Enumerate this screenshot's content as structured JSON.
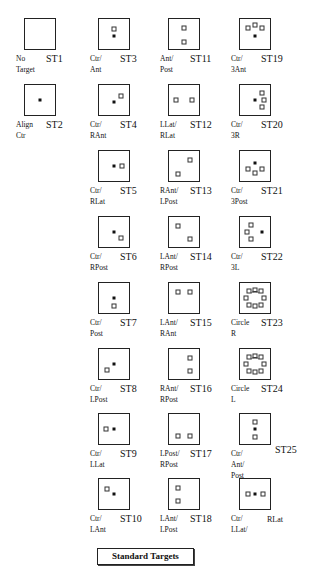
{
  "title": "Standard Targets",
  "targets": [
    {
      "code": "ST1",
      "label": [
        "No",
        "Target"
      ],
      "col": 0,
      "row": 0,
      "points": []
    },
    {
      "code": "ST2",
      "label": [
        "Align",
        "Ctr"
      ],
      "col": 0,
      "row": 1,
      "points": [
        {
          "x": 0.5,
          "y": 0.5,
          "t": "c"
        }
      ]
    },
    {
      "code": "ST3",
      "label": [
        "Ctr/",
        "Ant"
      ],
      "col": 1,
      "row": 0,
      "points": [
        {
          "x": 0.5,
          "y": 0.32,
          "t": "o"
        },
        {
          "x": 0.5,
          "y": 0.55,
          "t": "c"
        }
      ]
    },
    {
      "code": "ST4",
      "label": [
        "Ctr/",
        "RAnt"
      ],
      "col": 1,
      "row": 1,
      "points": [
        {
          "x": 0.5,
          "y": 0.55,
          "t": "c"
        },
        {
          "x": 0.72,
          "y": 0.35,
          "t": "o"
        }
      ]
    },
    {
      "code": "ST5",
      "label": [
        "Ctr/",
        "RLat"
      ],
      "col": 1,
      "row": 2,
      "points": [
        {
          "x": 0.5,
          "y": 0.5,
          "t": "c"
        },
        {
          "x": 0.78,
          "y": 0.5,
          "t": "o"
        }
      ]
    },
    {
      "code": "ST6",
      "label": [
        "Ctr/",
        "RPost"
      ],
      "col": 1,
      "row": 3,
      "points": [
        {
          "x": 0.5,
          "y": 0.5,
          "t": "c"
        },
        {
          "x": 0.72,
          "y": 0.7,
          "t": "o"
        }
      ]
    },
    {
      "code": "ST7",
      "label": [
        "Ctr/",
        "Post"
      ],
      "col": 1,
      "row": 4,
      "points": [
        {
          "x": 0.5,
          "y": 0.5,
          "t": "c"
        },
        {
          "x": 0.5,
          "y": 0.75,
          "t": "o"
        }
      ]
    },
    {
      "code": "ST8",
      "label": [
        "Ctr/",
        "LPost"
      ],
      "col": 1,
      "row": 5,
      "points": [
        {
          "x": 0.5,
          "y": 0.5,
          "t": "c"
        },
        {
          "x": 0.28,
          "y": 0.7,
          "t": "o"
        }
      ]
    },
    {
      "code": "ST9",
      "label": [
        "Ctr/",
        "LLat"
      ],
      "col": 1,
      "row": 6,
      "points": [
        {
          "x": 0.5,
          "y": 0.5,
          "t": "c"
        },
        {
          "x": 0.22,
          "y": 0.5,
          "t": "o"
        }
      ]
    },
    {
      "code": "ST10",
      "label": [
        "Ctr/",
        "LAnt"
      ],
      "col": 1,
      "row": 7,
      "points": [
        {
          "x": 0.5,
          "y": 0.5,
          "t": "c"
        },
        {
          "x": 0.28,
          "y": 0.33,
          "t": "o"
        }
      ]
    },
    {
      "code": "ST11",
      "label": [
        "Ant/",
        "Post"
      ],
      "col": 2,
      "row": 0,
      "points": [
        {
          "x": 0.5,
          "y": 0.3,
          "t": "o"
        },
        {
          "x": 0.5,
          "y": 0.75,
          "t": "o"
        }
      ]
    },
    {
      "code": "ST12",
      "label": [
        "LLat/",
        "RLat"
      ],
      "col": 2,
      "row": 1,
      "points": [
        {
          "x": 0.22,
          "y": 0.5,
          "t": "o"
        },
        {
          "x": 0.78,
          "y": 0.5,
          "t": "o"
        }
      ]
    },
    {
      "code": "ST13",
      "label": [
        "RAnt/",
        "LPost"
      ],
      "col": 2,
      "row": 2,
      "points": [
        {
          "x": 0.7,
          "y": 0.3,
          "t": "o"
        },
        {
          "x": 0.3,
          "y": 0.75,
          "t": "o"
        }
      ]
    },
    {
      "code": "ST14",
      "label": [
        "LAnt/",
        "RPost"
      ],
      "col": 2,
      "row": 3,
      "points": [
        {
          "x": 0.3,
          "y": 0.3,
          "t": "o"
        },
        {
          "x": 0.7,
          "y": 0.72,
          "t": "o"
        }
      ]
    },
    {
      "code": "ST15",
      "label": [
        "LAnt/",
        "RAnt"
      ],
      "col": 2,
      "row": 4,
      "points": [
        {
          "x": 0.3,
          "y": 0.3,
          "t": "o"
        },
        {
          "x": 0.7,
          "y": 0.3,
          "t": "o"
        }
      ]
    },
    {
      "code": "ST16",
      "label": [
        "RAnt/",
        "RPost"
      ],
      "col": 2,
      "row": 5,
      "points": [
        {
          "x": 0.7,
          "y": 0.3,
          "t": "o"
        },
        {
          "x": 0.7,
          "y": 0.72,
          "t": "o"
        }
      ]
    },
    {
      "code": "ST17",
      "label": [
        "LPost/",
        "RPost"
      ],
      "col": 2,
      "row": 6,
      "points": [
        {
          "x": 0.3,
          "y": 0.72,
          "t": "o"
        },
        {
          "x": 0.7,
          "y": 0.72,
          "t": "o"
        }
      ]
    },
    {
      "code": "ST18",
      "label": [
        "LAnt/",
        "LPost"
      ],
      "col": 2,
      "row": 7,
      "points": [
        {
          "x": 0.3,
          "y": 0.3,
          "t": "o"
        },
        {
          "x": 0.3,
          "y": 0.72,
          "t": "o"
        }
      ]
    },
    {
      "code": "ST19",
      "label": [
        "Ctr/",
        "3Ant"
      ],
      "col": 3,
      "row": 0,
      "points": [
        {
          "x": 0.28,
          "y": 0.3,
          "t": "o"
        },
        {
          "x": 0.5,
          "y": 0.2,
          "t": "o"
        },
        {
          "x": 0.72,
          "y": 0.3,
          "t": "o"
        },
        {
          "x": 0.5,
          "y": 0.55,
          "t": "c"
        }
      ]
    },
    {
      "code": "ST20",
      "label": [
        "Ctr/",
        "3R"
      ],
      "col": 3,
      "row": 1,
      "points": [
        {
          "x": 0.5,
          "y": 0.5,
          "t": "c"
        },
        {
          "x": 0.72,
          "y": 0.28,
          "t": "o"
        },
        {
          "x": 0.8,
          "y": 0.5,
          "t": "o"
        },
        {
          "x": 0.72,
          "y": 0.72,
          "t": "o"
        }
      ]
    },
    {
      "code": "ST21",
      "label": [
        "Ctr/",
        "3Post"
      ],
      "col": 3,
      "row": 2,
      "points": [
        {
          "x": 0.5,
          "y": 0.4,
          "t": "c"
        },
        {
          "x": 0.28,
          "y": 0.6,
          "t": "o"
        },
        {
          "x": 0.5,
          "y": 0.72,
          "t": "o"
        },
        {
          "x": 0.72,
          "y": 0.6,
          "t": "o"
        }
      ]
    },
    {
      "code": "ST22",
      "label": [
        "Ctr/",
        "3L"
      ],
      "col": 3,
      "row": 3,
      "points": [
        {
          "x": 0.72,
          "y": 0.5,
          "t": "c"
        },
        {
          "x": 0.35,
          "y": 0.28,
          "t": "o"
        },
        {
          "x": 0.22,
          "y": 0.5,
          "t": "o"
        },
        {
          "x": 0.35,
          "y": 0.72,
          "t": "o"
        }
      ]
    },
    {
      "code": "ST23",
      "label": [
        "Circle",
        "R"
      ],
      "col": 3,
      "row": 4,
      "circle": true,
      "points": [
        {
          "x": 0.3,
          "y": 0.28,
          "t": "o"
        },
        {
          "x": 0.5,
          "y": 0.22,
          "t": "o"
        },
        {
          "x": 0.7,
          "y": 0.28,
          "t": "o"
        },
        {
          "x": 0.2,
          "y": 0.5,
          "t": "o"
        },
        {
          "x": 0.8,
          "y": 0.5,
          "t": "o"
        },
        {
          "x": 0.3,
          "y": 0.72,
          "t": "o"
        },
        {
          "x": 0.5,
          "y": 0.78,
          "t": "o"
        },
        {
          "x": 0.7,
          "y": 0.72,
          "t": "o"
        }
      ]
    },
    {
      "code": "ST24",
      "label": [
        "Circle",
        "L"
      ],
      "col": 3,
      "row": 5,
      "circle": true,
      "points": [
        {
          "x": 0.3,
          "y": 0.28,
          "t": "o"
        },
        {
          "x": 0.5,
          "y": 0.22,
          "t": "o"
        },
        {
          "x": 0.7,
          "y": 0.28,
          "t": "o"
        },
        {
          "x": 0.2,
          "y": 0.5,
          "t": "o"
        },
        {
          "x": 0.8,
          "y": 0.5,
          "t": "o"
        },
        {
          "x": 0.3,
          "y": 0.72,
          "t": "o"
        },
        {
          "x": 0.5,
          "y": 0.78,
          "t": "o"
        },
        {
          "x": 0.7,
          "y": 0.72,
          "t": "o"
        }
      ]
    },
    {
      "code": "ST25",
      "label": [
        "Ctr/",
        "Ant/",
        "Post"
      ],
      "col": 3,
      "row": 6,
      "codeSide": true,
      "points": [
        {
          "x": 0.5,
          "y": 0.25,
          "t": "o"
        },
        {
          "x": 0.5,
          "y": 0.5,
          "t": "c"
        },
        {
          "x": 0.5,
          "y": 0.75,
          "t": "o"
        }
      ]
    },
    {
      "code": "RLat",
      "label": [
        "Ctr/",
        "LLat/"
      ],
      "col": 3,
      "row": 7,
      "codeSmall": true,
      "points": [
        {
          "x": 0.25,
          "y": 0.5,
          "t": "o"
        },
        {
          "x": 0.5,
          "y": 0.5,
          "t": "c"
        },
        {
          "x": 0.75,
          "y": 0.5,
          "t": "o"
        }
      ]
    }
  ]
}
